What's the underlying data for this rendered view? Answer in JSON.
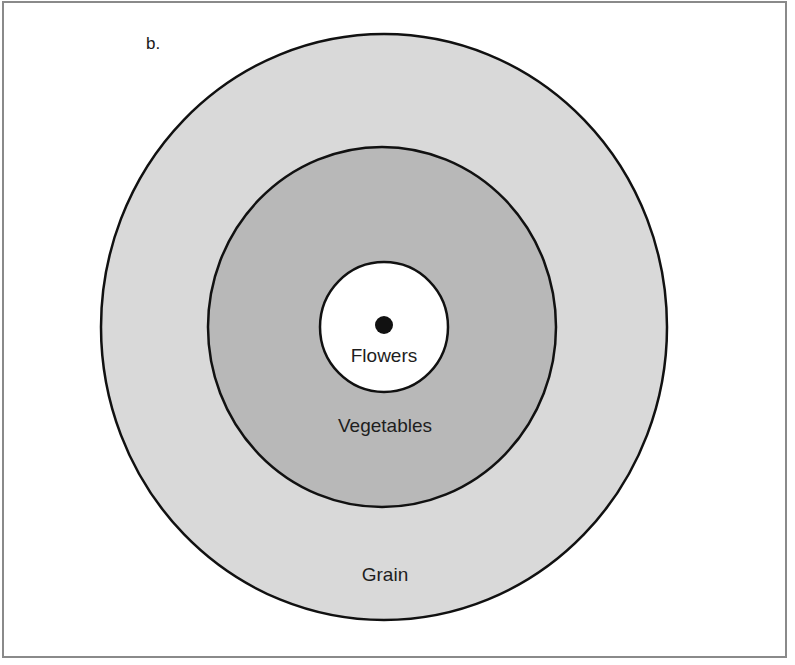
{
  "figure": {
    "panel_label": "b.",
    "colors": {
      "outer_ring_fill": "#d9d9d9",
      "middle_ring_fill": "#b8b8b8",
      "inner_ring_fill": "#ffffff",
      "stroke": "#111111",
      "frame": "#8a8a8a"
    },
    "rings": [
      {
        "id": "outer",
        "label": "Grain"
      },
      {
        "id": "middle",
        "label": "Vegetables"
      },
      {
        "id": "inner",
        "label": "Flowers"
      }
    ],
    "center_marker": "center-dot"
  }
}
